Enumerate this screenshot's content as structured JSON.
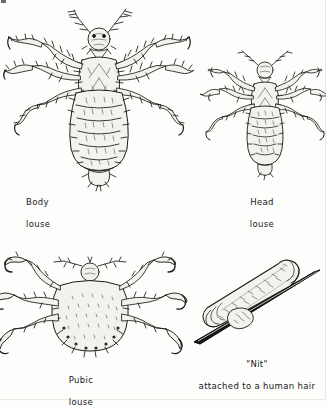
{
  "plate": {
    "title": "Lice and nit identification plate",
    "background_color": "#fdfdfb",
    "ink_color": "#1a1a18",
    "body_fill_color": "#f3f2ed",
    "hair_color": "#141412",
    "figure_count": 4
  },
  "figures": [
    {
      "id": "body-louse",
      "caption_line1": "Body",
      "caption_line2": "louse",
      "caption_full": "Body louse",
      "view": "dorsal",
      "position": {
        "x": 4,
        "y": 2,
        "width": 190,
        "height": 185
      },
      "caption_position": {
        "x": 26,
        "y": 186
      },
      "anatomy": {
        "antennae": 2,
        "legs": 6,
        "abdominal_segments": 8,
        "claws": 6,
        "body_shape": "elongate-oval",
        "relative_size": "largest"
      }
    },
    {
      "id": "head-louse",
      "caption_line1": "Head",
      "caption_line2": "louse",
      "caption_full": "Head louse",
      "view": "dorsal",
      "position": {
        "x": 209,
        "y": 44,
        "width": 112,
        "height": 140
      },
      "caption_position": {
        "x": 247,
        "y": 186
      },
      "anatomy": {
        "antennae": 2,
        "legs": 6,
        "abdominal_segments": 7,
        "claws": 6,
        "body_shape": "elongate-oval",
        "relative_size": "smaller-than-body-louse"
      }
    },
    {
      "id": "pubic-louse",
      "caption_line1": "Pubic",
      "caption_line2": "louse",
      "caption_full": "Pubic louse",
      "view": "dorsal",
      "position": {
        "x": 4,
        "y": 252,
        "width": 172,
        "height": 110
      },
      "caption_position": {
        "x": 62,
        "y": 364
      },
      "anatomy": {
        "antennae": 2,
        "legs": 6,
        "claws": 6,
        "body_shape": "broad-crab-like",
        "relative_size": "wide-and-squat"
      }
    },
    {
      "id": "nit",
      "caption_line1": "\"Nit\"",
      "caption_line2": "attached to a human hair",
      "caption_full": "\"Nit\" attached to a human hair",
      "view": "lateral",
      "position": {
        "x": 186,
        "y": 258,
        "width": 135,
        "height": 90
      },
      "caption_position": {
        "x": 196,
        "y": 349
      },
      "anatomy": {
        "egg_shape": "oval-capsule",
        "attachment": "cemented to hair shaft",
        "hair_orientation": "diagonal"
      }
    }
  ]
}
